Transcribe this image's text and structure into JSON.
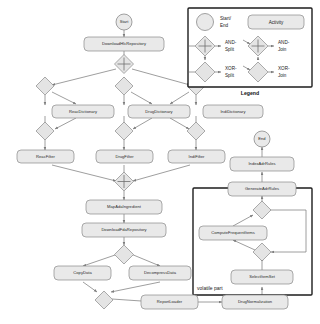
{
  "diagram": {
    "background": "#ffffff",
    "node_fill": "#e9e9e9",
    "node_stroke": "#8a8a8a",
    "frame_stroke": "#1d1d1d",
    "edge_color": "#7d7d7d"
  },
  "legend": {
    "title": "Legend",
    "items": [
      {
        "shape": "circle",
        "label": "Start/\nEnd",
        "line1": "Start/",
        "line2": "End"
      },
      {
        "shape": "rounded-rect",
        "label": "Activity",
        "line1": "Activity",
        "line2": ""
      },
      {
        "shape": "and-split",
        "label": "AND-\nSplit",
        "line1": "AND-",
        "line2": "Split"
      },
      {
        "shape": "and-join",
        "label": "AND-\nJoin",
        "line1": "AND-",
        "line2": "Join"
      },
      {
        "shape": "xor-split",
        "label": "XOR-\nSplit",
        "line1": "XOR-",
        "line2": "Split"
      },
      {
        "shape": "xor-join",
        "label": "XOR-\nJoin",
        "line1": "XOR-",
        "line2": "Join"
      }
    ]
  },
  "frames": [
    {
      "id": "volatile",
      "label": "volatile part"
    }
  ],
  "events": [
    {
      "id": "start",
      "label": "Start"
    },
    {
      "id": "end",
      "label": "End"
    }
  ],
  "activities": [
    {
      "id": "a1",
      "label": "DownloadHlcRepository"
    },
    {
      "id": "a2",
      "label": "ReacDictionary"
    },
    {
      "id": "a3",
      "label": "DrugDictionary"
    },
    {
      "id": "a4",
      "label": "IndiDictionary"
    },
    {
      "id": "a5",
      "label": "ReacFilter"
    },
    {
      "id": "a6",
      "label": "DrugFilter"
    },
    {
      "id": "a7",
      "label": "IndiFilter"
    },
    {
      "id": "a8",
      "label": "MapAdaIngredient"
    },
    {
      "id": "a9",
      "label": "DownloadFdaRepository"
    },
    {
      "id": "a10",
      "label": "CopyData"
    },
    {
      "id": "a11",
      "label": "DecompressData"
    },
    {
      "id": "a12",
      "label": "ReportLoader"
    },
    {
      "id": "a13",
      "label": "DrugNormalization"
    },
    {
      "id": "a14",
      "label": "SelectItemSet"
    },
    {
      "id": "a15",
      "label": "ComputeFrequentItems"
    },
    {
      "id": "a16",
      "label": "GenerateAdrRules"
    },
    {
      "id": "a17",
      "label": "IndexAdrRules"
    }
  ],
  "gateways": [
    {
      "id": "g1",
      "type": "and-split"
    },
    {
      "id": "g2",
      "type": "xor-split"
    },
    {
      "id": "g3",
      "type": "xor-split"
    },
    {
      "id": "g4",
      "type": "xor-split"
    },
    {
      "id": "g5",
      "type": "xor-join"
    },
    {
      "id": "g6",
      "type": "xor-join"
    },
    {
      "id": "g7",
      "type": "xor-join"
    },
    {
      "id": "g8",
      "type": "and-join"
    },
    {
      "id": "g9",
      "type": "xor-split"
    },
    {
      "id": "g10",
      "type": "xor-join"
    },
    {
      "id": "g11",
      "type": "xor-join"
    },
    {
      "id": "g12",
      "type": "xor-split"
    }
  ]
}
